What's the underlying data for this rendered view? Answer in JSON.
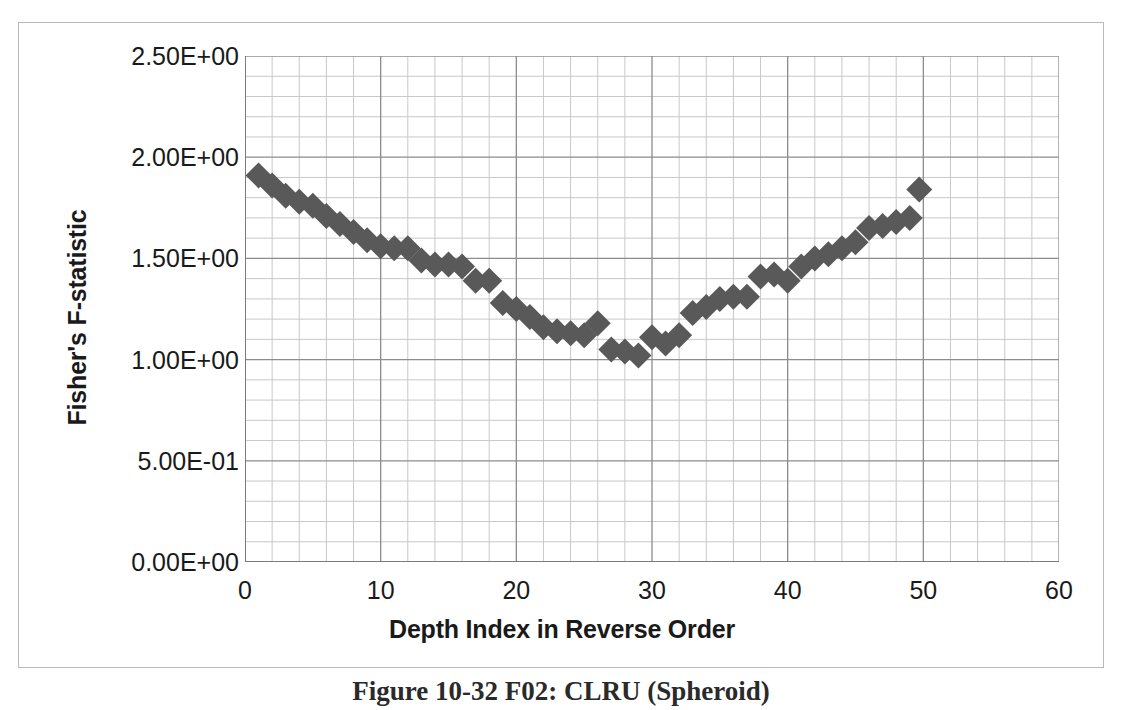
{
  "figure": {
    "caption": "Figure 10-32 F02: CLRU (Spheroid)"
  },
  "chart_data": {
    "type": "scatter",
    "title": "",
    "xlabel": "Depth Index in Reverse Order",
    "ylabel": "Fisher's F-statistic",
    "xlim": [
      0,
      60
    ],
    "ylim": [
      0,
      2.5
    ],
    "x_ticks": [
      0,
      10,
      20,
      30,
      40,
      50,
      60
    ],
    "x_tick_labels": [
      "0",
      "10",
      "20",
      "30",
      "40",
      "50",
      "60"
    ],
    "y_ticks": [
      0,
      0.5,
      1.0,
      1.5,
      2.0,
      2.5
    ],
    "y_tick_labels": [
      "0.00E+00",
      "5.00E-01",
      "1.00E+00",
      "1.50E+00",
      "2.00E+00",
      "2.50E+00"
    ],
    "x_minor_step": 2,
    "y_minor_step": 0.1,
    "grid": true,
    "grid_major_color": "#8c8c8c",
    "grid_minor_color": "#c8c8c8",
    "legend": false,
    "marker": "diamond",
    "marker_color": "#595959",
    "marker_size": 13,
    "series": [
      {
        "name": "Fisher's F-statistic",
        "points": [
          [
            1.0,
            1.91
          ],
          [
            2.0,
            1.86
          ],
          [
            3.0,
            1.81
          ],
          [
            4.0,
            1.78
          ],
          [
            5.0,
            1.76
          ],
          [
            6.0,
            1.71
          ],
          [
            7.0,
            1.67
          ],
          [
            8.0,
            1.63
          ],
          [
            9.0,
            1.59
          ],
          [
            10.0,
            1.56
          ],
          [
            11.0,
            1.55
          ],
          [
            12.0,
            1.55
          ],
          [
            13.0,
            1.49
          ],
          [
            14.0,
            1.47
          ],
          [
            15.0,
            1.47
          ],
          [
            16.0,
            1.46
          ],
          [
            17.0,
            1.39
          ],
          [
            18.0,
            1.39
          ],
          [
            19.0,
            1.28
          ],
          [
            20.0,
            1.25
          ],
          [
            21.0,
            1.21
          ],
          [
            22.0,
            1.16
          ],
          [
            23.0,
            1.14
          ],
          [
            24.0,
            1.13
          ],
          [
            25.0,
            1.12
          ],
          [
            26.0,
            1.18
          ],
          [
            27.0,
            1.05
          ],
          [
            28.0,
            1.04
          ],
          [
            29.0,
            1.02
          ],
          [
            30.0,
            1.11
          ],
          [
            31.0,
            1.08
          ],
          [
            32.0,
            1.12
          ],
          [
            33.0,
            1.23
          ],
          [
            34.0,
            1.26
          ],
          [
            35.0,
            1.3
          ],
          [
            36.0,
            1.31
          ],
          [
            37.0,
            1.31
          ],
          [
            38.0,
            1.41
          ],
          [
            39.0,
            1.42
          ],
          [
            40.0,
            1.39
          ],
          [
            41.0,
            1.46
          ],
          [
            42.0,
            1.5
          ],
          [
            43.0,
            1.52
          ],
          [
            44.0,
            1.55
          ],
          [
            45.0,
            1.58
          ],
          [
            46.0,
            1.65
          ],
          [
            47.0,
            1.66
          ],
          [
            48.0,
            1.68
          ],
          [
            49.0,
            1.7
          ],
          [
            49.7,
            1.84
          ]
        ]
      }
    ]
  }
}
